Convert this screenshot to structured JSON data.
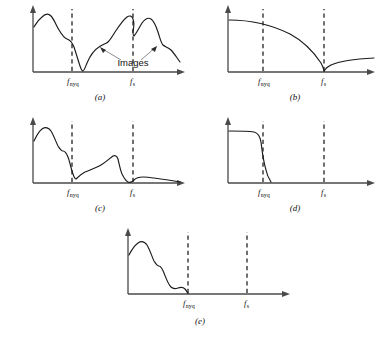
{
  "figure": {
    "title": "",
    "width": 380,
    "height": 342,
    "background_color": "#ffffff",
    "curve_color": "#1b1b1b",
    "axis_color": "#4a4a4a",
    "leader_color": "#7d7f86"
  },
  "labels": {
    "f_nyq_base": "f",
    "f_nyq_sub": "nyq",
    "f_s_base": "f",
    "f_s_sub": "s",
    "images_annotation": "Images"
  },
  "panels": [
    {
      "id": "a",
      "caption": "(a)",
      "description": "Wideband spectrum with aliased images folding about f_nyq and f_s",
      "ticks": [
        "f_nyq",
        "f_s"
      ],
      "has_images_annotation": true,
      "origin": [
        33,
        72
      ],
      "x_axis_end": 185,
      "y_axis_top": 7,
      "f_nyq_x": 72,
      "f_s_x": 133,
      "curve": "M34,27 C36,24 38,20 42,17 C45,14 48,13 51,16 C54,19 56,25 59,30 C62,35 64,38 67,39 C70,40 72,42 74,47 C76,53 78,60 80,66 C81,69 82,71 83,71 C84,71 85,68 87,63 C90,56 94,50 99,47 C103,44 106,44 108,42 C110,40 112,37 115,32 C119,26 123,20 127,17 C130,15 132,16 133,19 C134,22 134,27 133,31 C133,34 133,36 134,36 C136,34 139,28 142,23 C145,19 148,17 151,19 C154,21 156,26 158,32 C160,38 161,43 163,45 C165,47 168,47 171,50 C174,53 177,58 180,62"
    },
    {
      "id": "b",
      "caption": "(b)",
      "description": "Lowpass anti-alias filter response rolling off to a null at f_s then rising again",
      "ticks": [
        "f_nyq",
        "f_s"
      ],
      "has_images_annotation": false,
      "origin": [
        228,
        72
      ],
      "x_axis_end": 375,
      "y_axis_top": 7,
      "f_nyq_x": 263,
      "f_s_x": 324,
      "curve": "M229,20 C250,20 272,25 290,34 C305,42 315,54 321,63 C323,67 324,70 324,71.5 C325,69 327,67 331,65 C340,61 355,59 374,58"
    },
    {
      "id": "c",
      "caption": "(c)",
      "description": "Filtered spectrum with reduced images, nulls at f_nyq and f_s",
      "ticks": [
        "f_nyq",
        "f_s"
      ],
      "has_images_annotation": false,
      "origin": [
        33,
        183
      ],
      "x_axis_end": 185,
      "y_axis_top": 119,
      "f_nyq_x": 72,
      "f_s_x": 133,
      "curve": "M34,141 C36,137 38,132 42,129 C45,127 48,127 51,131 C54,136 56,142 58,146 C60,149 61,151 63,151 C65,151 66,152 68,157 C70,162 71,169 73,174 C74,177 75,179 76,179 C78,177 81,174 85,172 C90,170 96,168 101,165 C106,162 110,158 113,156 C115,155 117,156 118,159 C119,163 120,169 122,174 C124,178 126,181 128,182 C130,183 132,182 134,180 C136,178 139,177 143,177 C150,177 162,179 180,182"
    },
    {
      "id": "d",
      "caption": "(d)",
      "description": "Sharp brickwall lowpass filter cutting off at f_nyq",
      "ticks": [
        "f_nyq",
        "f_s"
      ],
      "has_images_annotation": false,
      "origin": [
        228,
        183
      ],
      "x_axis_end": 375,
      "y_axis_top": 119,
      "f_nyq_x": 263,
      "f_s_x": 324,
      "curve": "M229,131 C238,131 248,131 254,132 C258,133 260,136 261,142 C262,150 263,160 266,170 C267,175 269,179 271,182"
    },
    {
      "id": "e",
      "caption": "(e)",
      "description": "Resulting baseband spectrum, all energy below f_nyq, no images remain",
      "ticks": [
        "f_nyq",
        "f_s"
      ],
      "has_images_annotation": false,
      "origin": [
        128,
        294
      ],
      "x_axis_end": 290,
      "y_axis_top": 230,
      "f_nyq_x": 188,
      "f_s_x": 247,
      "curve": "M129,255 C131,251 134,246 138,243 C141,241 144,241 147,245 C150,250 152,257 154,261 C156,264 157,266 159,266 C161,266 162,268 164,273 C166,278 168,284 171,287 C173,289 175,289 178,288 C181,287 183,287 185,289 C186,290 187,292 188,293.5"
    }
  ]
}
